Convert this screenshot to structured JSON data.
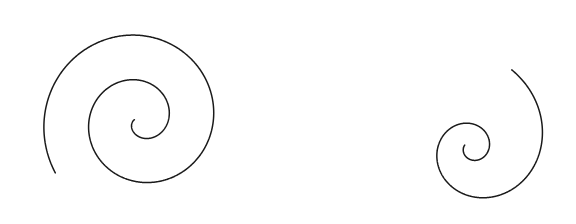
{
  "figure": {
    "width": 576,
    "height": 224,
    "background_color": "#ffffff",
    "stroke_color": "#1a1a1a",
    "stroke_width": 1.5
  },
  "chart_data": {
    "type": "line",
    "xlabel": "",
    "ylabel": "",
    "xlim": [
      0,
      576
    ],
    "ylim": [
      0,
      224
    ],
    "grid": false,
    "legend": "none",
    "axes_visible": false,
    "tick_labels": [],
    "annotations": [],
    "series": [
      {
        "name": "left-archimedean-spiral",
        "curve_type": "archimedean",
        "description": "Spiral with constant spacing between successive turns, winding clockwise inward from the lower-left.",
        "center": [
          140,
          120
        ],
        "polar_form": "r = a + b*theta",
        "a": 2.5,
        "b": 7.15,
        "theta_start_deg": 780,
        "theta_end_deg": 25,
        "theta_direction": "inward",
        "turn_spacing_px": 45,
        "turns": 2.1,
        "max_radius_px": 96,
        "min_radius_px": 6,
        "angle_offset_deg": 152,
        "y_flip": true,
        "outer_endpoint": [
          27,
          102
        ],
        "inner_endpoint": [
          144,
          124
        ],
        "bbox": [
          27,
          22,
          236,
          212
        ]
      },
      {
        "name": "right-logarithmic-spiral",
        "curve_type": "logarithmic",
        "description": "Spiral whose radius grows exponentially, producing a tight eye and a wide outer sweep.",
        "center": [
          472,
          148
        ],
        "polar_form": "r = a * exp(b*theta)",
        "a": 7.0,
        "b": 0.2211,
        "theta_start_deg": 655,
        "theta_end_deg": 30,
        "theta_direction": "inward",
        "turns": 1.74,
        "max_radius_px": 130,
        "min_radius_px": 9,
        "angle_offset_deg": 128,
        "y_flip": true,
        "outer_endpoint": [
          293,
          117
        ],
        "inner_endpoint": [
          477,
          151
        ],
        "bbox": [
          293,
          24,
          556,
          212
        ]
      }
    ]
  }
}
